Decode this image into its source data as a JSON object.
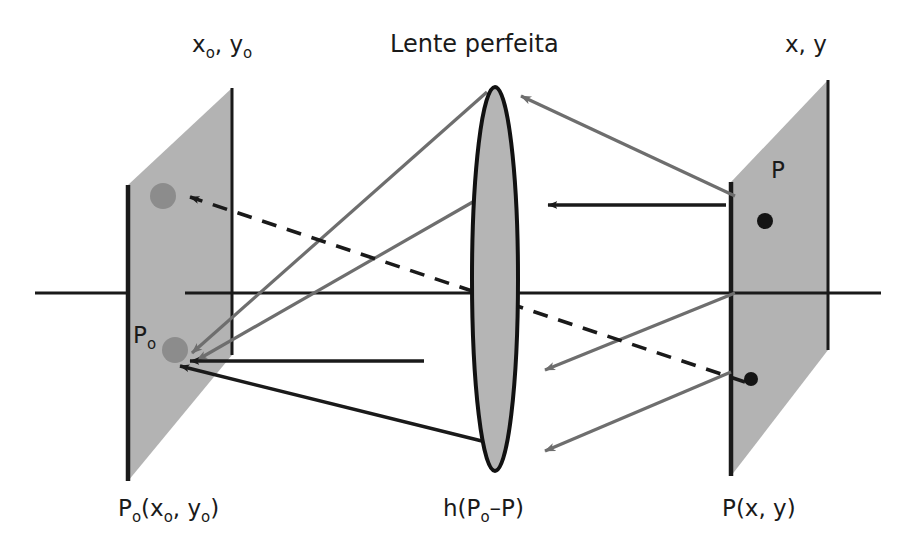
{
  "figure": {
    "title_center_top": "Lente perfeita",
    "label_top_left_main": "x",
    "label_top_left_sub": "o",
    "label_top_left_main2": ", y",
    "label_top_left_sub2": "o",
    "label_top_right": "x, y",
    "label_plane_left_inplane_main": "P",
    "label_plane_left_inplane_sub": "o",
    "label_plane_right_inplane": "P",
    "label_bottom_left_main": "P",
    "label_bottom_left_sub": "o",
    "label_bottom_left_rest": "(x",
    "label_bottom_left_sub2": "o",
    "label_bottom_left_rest2": ", y",
    "label_bottom_left_sub3": "o",
    "label_bottom_left_rest3": ")",
    "label_bottom_center_main": "h(P",
    "label_bottom_center_sub": "o",
    "label_bottom_center_rest": "–P)",
    "label_bottom_right_main": "P",
    "label_bottom_right_rest": "(x, y)"
  },
  "colors": {
    "plane_fill": "#b3b3b3",
    "lens_fill": "#b5b5b5",
    "stroke_dark": "#1a1a1a",
    "stroke_gray_ray": "#6e6e6e",
    "dot_gray": "#8c8c8c",
    "dot_black": "#141414",
    "background": "#ffffff"
  },
  "geometry": {
    "optical_axis_y": 293,
    "optical_axis_x_start": 35,
    "optical_axis_x_end": 881,
    "lens_center_x": 495,
    "lens_center_y": 279,
    "lens_rx": 23,
    "lens_ry": 192
  },
  "elements": {
    "object_plane_name": "object-plane-left",
    "image_plane_name": "image-plane-right",
    "lens_name": "perfect-lens",
    "dot_upper_left_name": "gray-dot-upper",
    "dot_lower_left_name": "gray-dot-lower",
    "dot_upper_right_name": "black-dot-upper",
    "dot_lower_right_name": "black-dot-lower"
  }
}
